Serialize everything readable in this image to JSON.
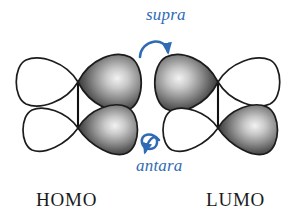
{
  "figure": {
    "type": "orbital-symmetry-diagram",
    "background_color": "#ffffff",
    "width": 298,
    "height": 220
  },
  "colors": {
    "accent_blue": "#2f6bb5",
    "orbital_outline": "#1c1c1c",
    "orbital_fill_dark": "#4a4a4a",
    "orbital_fill_light": "#ffffff",
    "bond_line": "#111111",
    "text_black": "#1a1a1a"
  },
  "labels": {
    "supra": "supra",
    "antara": "antara",
    "homo": "HOMO",
    "lumo": "LUMO"
  },
  "annotations": {
    "supra_arrow": "suprafacial-arc-arrow",
    "antara_arrow": "antarafacial-twisted-arrow"
  },
  "orbitals": {
    "homo": {
      "name": "HOMO",
      "description": "highest occupied molecular orbital",
      "lobes": [
        {
          "position": "top-left",
          "phase": "light"
        },
        {
          "position": "top-right",
          "phase": "dark"
        },
        {
          "position": "bottom-left",
          "phase": "light"
        },
        {
          "position": "bottom-right",
          "phase": "dark"
        }
      ]
    },
    "lumo": {
      "name": "LUMO",
      "description": "lowest unoccupied molecular orbital",
      "lobes": [
        {
          "position": "top-left",
          "phase": "dark"
        },
        {
          "position": "top-right",
          "phase": "light"
        },
        {
          "position": "bottom-left",
          "phase": "light"
        },
        {
          "position": "bottom-right",
          "phase": "dark"
        }
      ]
    }
  }
}
